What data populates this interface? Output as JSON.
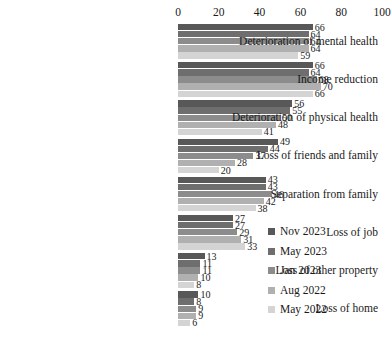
{
  "chart_data": {
    "type": "bar",
    "orientation": "horizontal",
    "title": "",
    "subtitle": "",
    "xlabel": "",
    "ylabel": "",
    "xlim": [
      0,
      100
    ],
    "xticks": [
      0,
      20,
      40,
      60,
      80,
      100
    ],
    "grid": false,
    "legend_position": "right",
    "categories": [
      "Deterioration of mental health",
      "Income reduction",
      "Deterioration of physical health",
      "Loss of friends and family",
      "Separation from family",
      "Loss of job",
      "Loss of other property",
      "Loss of home"
    ],
    "series": [
      {
        "name": "Nov 2023",
        "color": "#585858",
        "values": [
          66,
          66,
          56,
          49,
          43,
          27,
          13,
          10
        ]
      },
      {
        "name": "May 2023",
        "color": "#6e6e6e",
        "values": [
          64,
          64,
          55,
          44,
          43,
          27,
          11,
          8
        ]
      },
      {
        "name": "Jan 2023",
        "color": "#8c8c8c",
        "values": [
          64,
          68,
          50,
          37,
          46,
          29,
          11,
          9
        ]
      },
      {
        "name": "Aug 2022",
        "color": "#b0b0b0",
        "values": [
          64,
          70,
          48,
          28,
          42,
          31,
          10,
          9
        ]
      },
      {
        "name": "May 2022",
        "color": "#d4d4d4",
        "values": [
          59,
          66,
          41,
          20,
          38,
          33,
          8,
          6
        ]
      }
    ]
  }
}
